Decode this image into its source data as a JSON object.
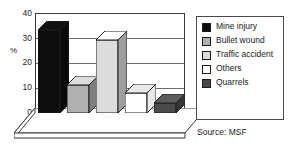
{
  "chart_data": {
    "type": "bar",
    "title": "",
    "subtitle": "",
    "xlabel": "",
    "ylabel": "%",
    "ylim": [
      0,
      40
    ],
    "yticks": [
      0,
      10,
      20,
      30,
      40
    ],
    "grid": true,
    "legend_position": "right",
    "three_d": true,
    "categories": [
      "Mine injury",
      "Bullet wound",
      "Traffic accident",
      "Others",
      "Quarrels"
    ],
    "values": [
      33,
      11,
      29,
      8,
      4
    ],
    "colors": [
      "#0d0d0d",
      "#b0b0b0",
      "#dcdcdc",
      "#ffffff",
      "#4a4a4a"
    ],
    "annotations": [
      "Source: MSF"
    ]
  },
  "axis": {
    "unit_label": "%",
    "ticks": [
      "40",
      "30",
      "20",
      "10",
      "0"
    ]
  },
  "legend": {
    "items": [
      {
        "label": "Mine injury",
        "color": "#0d0d0d"
      },
      {
        "label": "Bullet wound",
        "color": "#b0b0b0"
      },
      {
        "label": "Traffic accident",
        "color": "#dcdcdc"
      },
      {
        "label": "Others",
        "color": "#ffffff"
      },
      {
        "label": "Quarrels",
        "color": "#4a4a4a"
      }
    ]
  },
  "source": {
    "text": "Source: MSF"
  }
}
